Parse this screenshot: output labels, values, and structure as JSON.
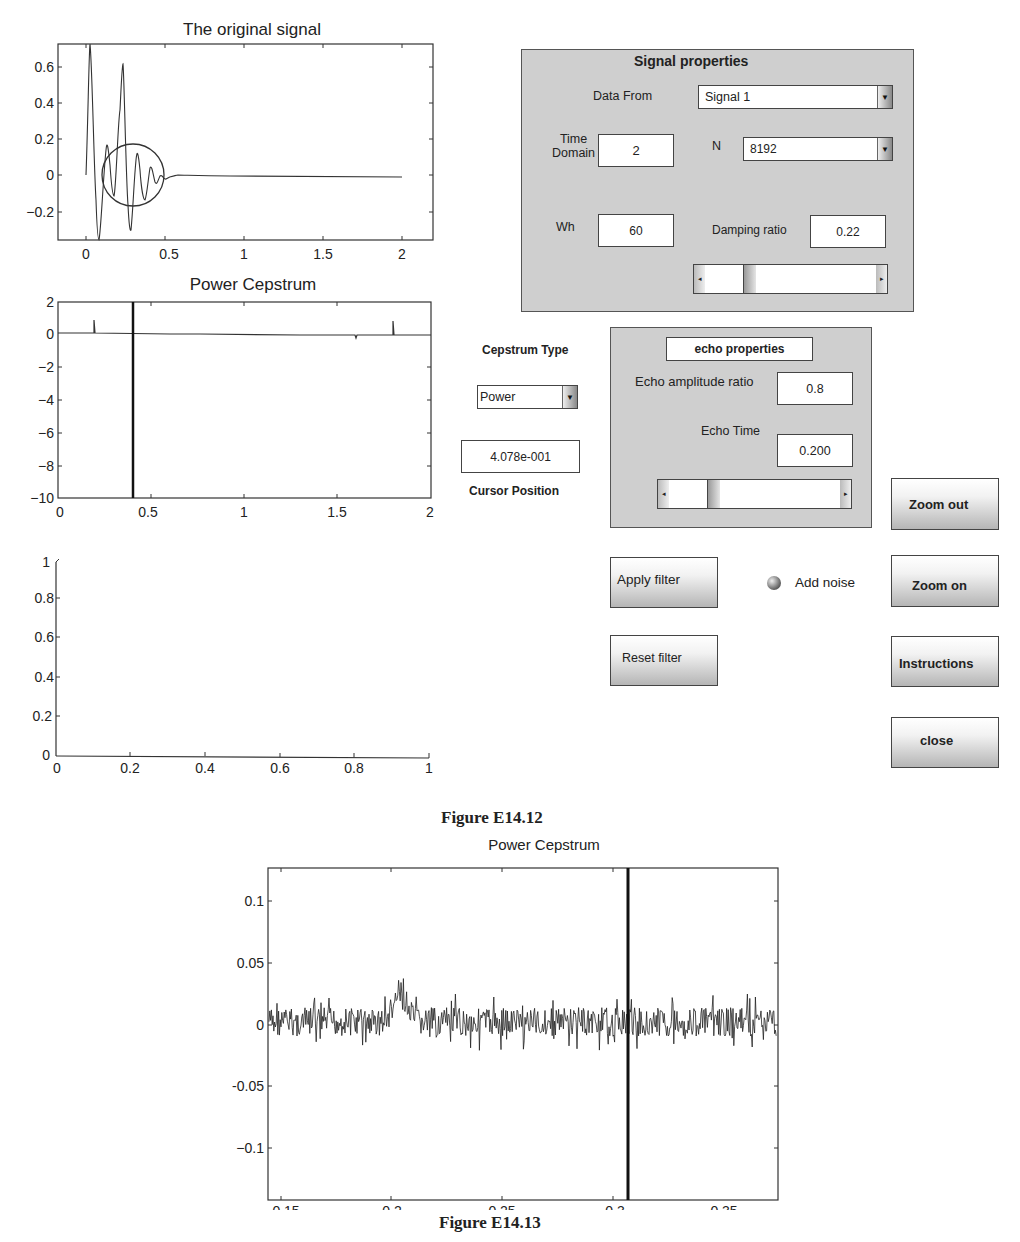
{
  "plots": {
    "original_signal": {
      "title": "The original signal",
      "y_ticks": [
        "0.6",
        "0.4",
        "0.2",
        "0",
        "−0.2"
      ],
      "x_ticks": [
        "0",
        "0.5",
        "1",
        "1.5",
        "2"
      ]
    },
    "power_cepstrum": {
      "title": "Power Cepstrum",
      "y_ticks": [
        "2",
        "0",
        "−2",
        "−4",
        "−6",
        "−8",
        "−10"
      ],
      "x_ticks": [
        "0",
        "0.5",
        "1",
        "1.5",
        "2"
      ]
    },
    "empty_axes": {
      "y_ticks": [
        "1",
        "0.8",
        "0.6",
        "0.4",
        "0.2",
        "0"
      ],
      "x_ticks": [
        "0",
        "0.2",
        "0.4",
        "0.6",
        "0.8",
        "1"
      ]
    },
    "zoomed_cepstrum": {
      "title": "Power Cepstrum",
      "y_ticks": [
        "0.1",
        "0.05",
        "0",
        "-0.05",
        "−0.1"
      ],
      "x_ticks": [
        "0.15",
        "0.2",
        "0.25",
        "0.3",
        "0.35"
      ]
    }
  },
  "signal_properties": {
    "title": "Signal properties",
    "data_from_label": "Data From",
    "data_from_value": "Signal 1",
    "time_domain_label_1": "Time",
    "time_domain_label_2": "Domain",
    "time_domain_value": "2",
    "n_label": "N",
    "n_value": "8192",
    "wh_label": "Wh",
    "wh_value": "60",
    "damping_label": "Damping ratio",
    "damping_value": "0.22"
  },
  "cepstrum_controls": {
    "type_label": "Cepstrum Type",
    "type_value": "Power",
    "cursor_value": "4.078e-001",
    "cursor_label": "Cursor Position"
  },
  "echo_properties": {
    "title": "echo properties",
    "amplitude_label": "Echo amplitude ratio",
    "amplitude_value": "0.8",
    "time_label": "Echo Time",
    "time_value": "0.200"
  },
  "buttons": {
    "zoom_out": "Zoom out",
    "apply_filter": "Apply filter",
    "add_noise": "Add noise",
    "zoom_on": "Zoom on",
    "reset_filter": "Reset filter",
    "instructions": "Instructions",
    "close": "close"
  },
  "captions": {
    "figure_1": "Figure E14.12",
    "figure_2": "Figure E14.13"
  },
  "chart_data": [
    {
      "type": "line",
      "title": "The original signal",
      "xlabel": "",
      "ylabel": "",
      "xlim": [
        -0.15,
        2.15
      ],
      "ylim": [
        -0.35,
        0.72
      ],
      "x_ticks": [
        0,
        0.5,
        1,
        1.5,
        2
      ],
      "y_ticks": [
        -0.2,
        0,
        0.2,
        0.4,
        0.6
      ],
      "series": [
        {
          "name": "signal",
          "x": [
            0,
            0.04,
            0.09,
            0.13,
            0.17,
            0.22,
            0.27,
            0.32,
            0.37,
            0.42,
            0.47,
            0.55,
            0.65,
            2.0
          ],
          "values": [
            0,
            0.72,
            -0.35,
            0.17,
            -0.08,
            0.6,
            -0.3,
            0.14,
            -0.08,
            0.03,
            -0.02,
            0.005,
            0,
            0
          ]
        }
      ],
      "annotations": [
        "circle highlighting echo around t=0.2-0.45"
      ],
      "grid": false
    },
    {
      "type": "line",
      "title": "Power Cepstrum",
      "xlim": [
        0,
        2
      ],
      "ylim": [
        -10,
        2
      ],
      "x_ticks": [
        0,
        0.5,
        1,
        1.5,
        2
      ],
      "y_ticks": [
        -10,
        -8,
        -6,
        -4,
        -2,
        0,
        2
      ],
      "series": [
        {
          "name": "cepstrum",
          "x": [
            0,
            0.2,
            0.4,
            0.6,
            1.6,
            1.8,
            2.0
          ],
          "values": [
            0,
            0.8,
            0,
            0,
            -0.3,
            0.7,
            0
          ]
        }
      ],
      "cursor_x": 0.4078,
      "grid": false
    },
    {
      "type": "line",
      "title": "",
      "xlim": [
        0,
        1
      ],
      "ylim": [
        0,
        1
      ],
      "x_ticks": [
        0,
        0.2,
        0.4,
        0.6,
        0.8,
        1
      ],
      "y_ticks": [
        0,
        0.2,
        0.4,
        0.6,
        0.8,
        1
      ],
      "series": [],
      "grid": false
    },
    {
      "type": "line",
      "title": "Power Cepstrum",
      "xlim": [
        0.143,
        0.351
      ],
      "ylim": [
        -0.118,
        0.126
      ],
      "x_ticks": [
        0.15,
        0.2,
        0.25,
        0.3,
        0.35
      ],
      "y_ticks": [
        -0.1,
        -0.05,
        0,
        0.05,
        0.1
      ],
      "series": [
        {
          "name": "cepstrum (noisy)",
          "x": [
            0.15,
            0.17,
            0.19,
            0.2,
            0.205,
            0.21,
            0.23,
            0.25,
            0.27,
            0.29,
            0.31,
            0.33,
            0.35
          ],
          "values": [
            0,
            0.01,
            0.005,
            0.055,
            0.04,
            0,
            -0.005,
            0.005,
            0,
            0,
            0.01,
            0,
            0
          ]
        }
      ],
      "noise_band": [
        -0.03,
        0.03
      ],
      "cursor_x": 0.289,
      "grid": false
    }
  ]
}
